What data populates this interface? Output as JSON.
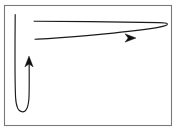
{
  "figure": {
    "background_color": "#ffffff",
    "frame": {
      "name": "image-border",
      "stroke_color": "#7a7a7a",
      "fill_color": "#ffffff",
      "x": 4,
      "y": 5,
      "width": 168,
      "height": 121,
      "stroke_width": 1.1
    },
    "stroke_color": "#1a1a1a",
    "arrow_fill_color": "#111111",
    "caption": "Two elongated U-turn paths with arrowheads",
    "shapes": [
      {
        "name": "vertical-u-turn-path",
        "type": "hairpin",
        "orientation": "vertical",
        "description": "Narrow U-shaped path descending at left, turning at the bottom and rising back up",
        "start": [
          15,
          14
        ],
        "turn": [
          22,
          111
        ],
        "end": [
          29,
          58
        ],
        "arrow_direction": "up",
        "arrow_tip": [
          29,
          56
        ]
      },
      {
        "name": "horizontal-loop-path",
        "type": "hairpin",
        "orientation": "horizontal",
        "description": "Narrow elongated loop running right from upper left, turning at the right tip and returning left",
        "start": [
          34,
          21
        ],
        "turn": [
          167,
          23
        ],
        "end": [
          35,
          39
        ],
        "arrow_direction": "right",
        "arrow_tip": [
          136,
          38
        ]
      }
    ],
    "arrowheads": [
      {
        "name": "up-arrowhead",
        "direction": "up",
        "tip_x": 29,
        "tip_y": 56,
        "length": 11,
        "half_width": 4.2
      },
      {
        "name": "right-arrowhead",
        "direction": "right",
        "tip_x": 136,
        "tip_y": 38,
        "length": 11,
        "half_width": 4.2
      }
    ]
  }
}
